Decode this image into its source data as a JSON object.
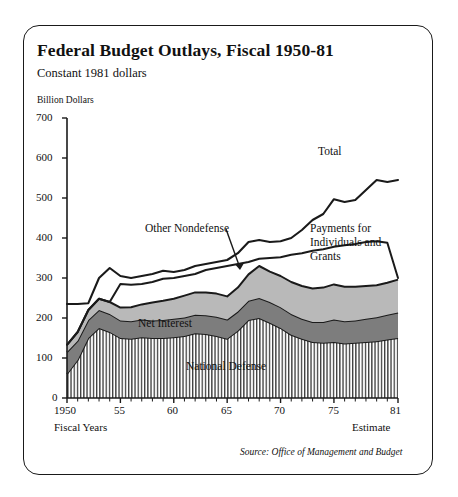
{
  "figure": {
    "title": "Federal Budget Outlays, Fiscal 1950-81",
    "subtitle": "Constant 1981 dollars",
    "unit_label": "Billion Dollars",
    "source": "Source: Office of Management and Budget",
    "x_axis_caption_left": "Fiscal Years",
    "x_axis_caption_right": "Estimate"
  },
  "annotations": {
    "total": "Total",
    "other_nondefense": "Other Nondefense",
    "payments": "Payments for\nIndividuals and\nGrants",
    "payments_line1": "Payments for",
    "payments_line2": "Individuals and",
    "payments_line3": "Grants",
    "net_interest": "Net Interest",
    "national_defense": "National Defense"
  },
  "colors": {
    "line": "#1a1a1a",
    "payments_band": "#b9b9b9",
    "net_interest_band": "#7d7d7d",
    "national_defense_band": "#ffffff",
    "border": "#1a1a1a",
    "background": "#ffffff"
  },
  "ytick_labels": [
    "0",
    "100",
    "200",
    "300",
    "400",
    "500",
    "600",
    "700"
  ],
  "xtick_labels": [
    "1950",
    "55",
    "60",
    "65",
    "70",
    "75",
    "81"
  ],
  "chart_data": {
    "type": "area",
    "title": "Federal Budget Outlays, Fiscal 1950-81",
    "subtitle": "Constant 1981 dollars",
    "xlabel": "Fiscal Years",
    "ylabel": "Billion Dollars",
    "xlim": [
      1950,
      1981
    ],
    "ylim": [
      0,
      700
    ],
    "yticks": [
      0,
      100,
      200,
      300,
      400,
      500,
      600,
      700
    ],
    "xticks": [
      1950,
      1955,
      1960,
      1965,
      1970,
      1975,
      1981
    ],
    "grid": false,
    "legend": "inline-annotations",
    "stacked": true,
    "x": [
      1950,
      1951,
      1952,
      1953,
      1954,
      1955,
      1956,
      1957,
      1958,
      1959,
      1960,
      1961,
      1962,
      1963,
      1964,
      1965,
      1966,
      1967,
      1968,
      1969,
      1970,
      1971,
      1972,
      1973,
      1974,
      1975,
      1976,
      1977,
      1978,
      1979,
      1980,
      1981
    ],
    "series": [
      {
        "name": "National Defense",
        "fill": "hatched-vertical",
        "values": [
          60,
          95,
          150,
          175,
          165,
          150,
          148,
          152,
          150,
          150,
          152,
          155,
          162,
          160,
          155,
          148,
          168,
          195,
          200,
          188,
          175,
          158,
          148,
          140,
          138,
          140,
          136,
          138,
          140,
          142,
          146,
          150
        ]
      },
      {
        "name": "Net Interest",
        "fill": "dark-gray",
        "values": [
          55,
          48,
          45,
          45,
          45,
          44,
          44,
          44,
          44,
          45,
          46,
          46,
          46,
          47,
          48,
          48,
          48,
          48,
          50,
          52,
          52,
          52,
          50,
          50,
          52,
          56,
          56,
          56,
          58,
          60,
          62,
          64
        ]
      },
      {
        "name": "Payments for Individuals and Grants",
        "fill": "light-gray",
        "values": [
          18,
          22,
          25,
          28,
          30,
          32,
          35,
          38,
          45,
          48,
          50,
          55,
          56,
          57,
          58,
          58,
          60,
          66,
          80,
          76,
          78,
          80,
          82,
          84,
          86,
          88,
          86,
          84,
          82,
          80,
          80,
          82
        ]
      }
    ],
    "lines": [
      {
        "name": "Total",
        "values": [
          235,
          235,
          237,
          300,
          325,
          305,
          300,
          305,
          310,
          318,
          315,
          320,
          330,
          335,
          340,
          345,
          362,
          390,
          395,
          390,
          392,
          400,
          420,
          445,
          460,
          497,
          490,
          495,
          520,
          545,
          540,
          545,
          560,
          580,
          590,
          600,
          605,
          610,
          615
        ],
        "x_values": [
          1950,
          1951,
          1952,
          1953,
          1954,
          1955,
          1956,
          1957,
          1958,
          1959,
          1960,
          1961,
          1962,
          1963,
          1964,
          1965,
          1966,
          1967,
          1968,
          1969,
          1970,
          1971,
          1972,
          1973,
          1974,
          1975,
          1976,
          1977,
          1978,
          1979,
          1980,
          1981
        ]
      },
      {
        "name": "Other Nondefense",
        "values": [
          133,
          165,
          220,
          248,
          240,
          285,
          283,
          285,
          290,
          298,
          300,
          305,
          310,
          320,
          325,
          330,
          335,
          340,
          348,
          350,
          352,
          358,
          362,
          368,
          372,
          378,
          382,
          385,
          390,
          392,
          388,
          300
        ]
      }
    ],
    "notes": [
      "Total line begins at about 235 in 1950, dips then rises steadily to about 615 by 1981.",
      "The Other Nondefense line crosses the Total-stack region around 1967 and is marked with a leader arrow into the light-gray Payments band.",
      "Stacked bands from the baseline upward: National Defense (vertical hatch), Net Interest (dark gray), Payments for Individuals and Grants (light gray).",
      "Peak of the stacked areas occurs around 1968 at roughly 330 billion."
    ]
  }
}
